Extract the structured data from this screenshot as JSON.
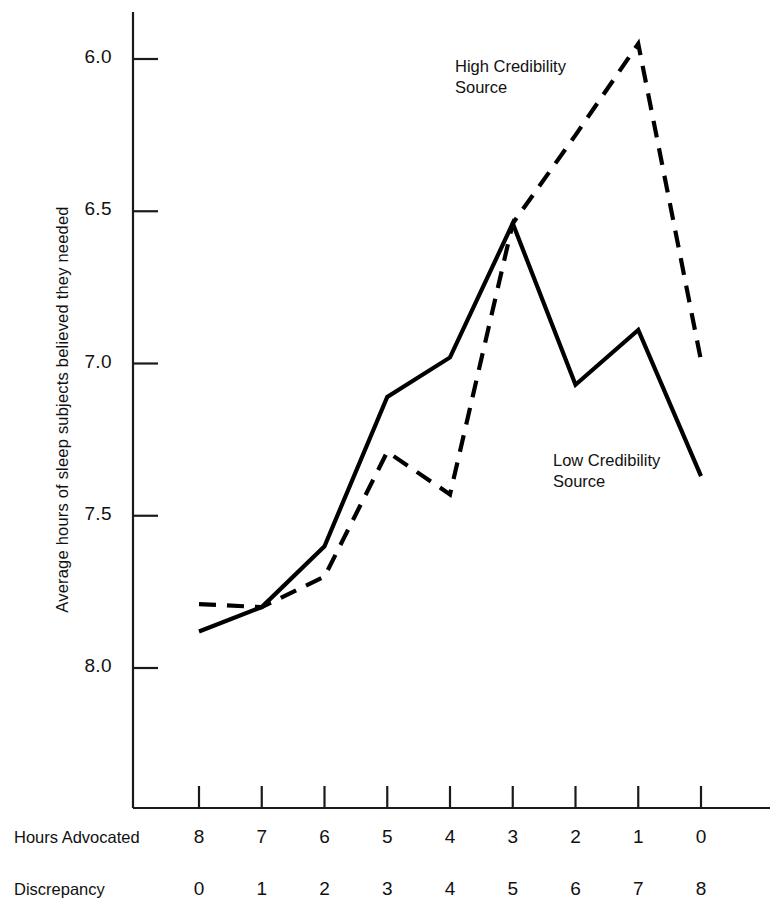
{
  "chart_data": {
    "type": "line",
    "title": "",
    "xlabel": "Hours Advocated / Discrepancy",
    "ylabel": "Average hours of sleep subjects believed they needed",
    "y_axis": {
      "inverted": true,
      "ticks": [
        "6.0",
        "6.5",
        "7.0",
        "7.5",
        "8.0"
      ],
      "tick_values": [
        6.0,
        6.5,
        7.0,
        7.5,
        8.0
      ],
      "ylim": [
        6.0,
        8.0
      ],
      "grid": false
    },
    "x_axis": {
      "rows": [
        {
          "label": "Hours Advocated",
          "ticks": [
            "8",
            "7",
            "6",
            "5",
            "4",
            "3",
            "2",
            "1",
            "0"
          ]
        },
        {
          "label": "Discrepancy",
          "ticks": [
            "0",
            "1",
            "2",
            "3",
            "4",
            "5",
            "6",
            "7",
            "8"
          ]
        }
      ]
    },
    "categories": [
      0,
      1,
      2,
      3,
      4,
      5,
      6,
      7,
      8
    ],
    "series": [
      {
        "name": "Low Credibility Source",
        "style": "solid",
        "color": "#000000",
        "values": [
          7.88,
          7.8,
          7.6,
          7.11,
          6.98,
          6.54,
          7.07,
          6.89,
          7.37
        ]
      },
      {
        "name": "High Credibility Source",
        "style": "dashed",
        "color": "#000000",
        "values": [
          7.79,
          7.8,
          7.7,
          7.29,
          7.43,
          6.54,
          6.25,
          5.95,
          6.99
        ]
      }
    ],
    "annotations": [
      {
        "text": "High Credibility\nSource",
        "series": "High Credibility Source"
      },
      {
        "text": "Low Credibility\nSource",
        "series": "Low Credibility Source"
      }
    ],
    "legend_position": "inline-annotations"
  },
  "colors": {
    "background": "#ffffff",
    "ink": "#000000",
    "axis": "#1a1a1a"
  }
}
